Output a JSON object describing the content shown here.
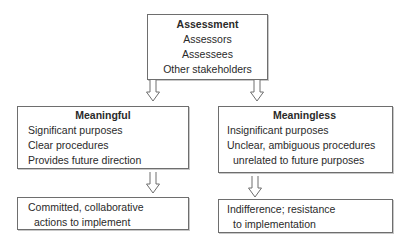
{
  "top": {
    "title": "Assessment",
    "items": [
      "Assessors",
      "Assessees",
      "Other stakeholders"
    ]
  },
  "left": {
    "title": "Meaningful",
    "items": [
      "Significant purposes",
      "Clear procedures",
      "Provides future direction"
    ],
    "outcome": [
      "Committed, collaborative",
      "actions to implement"
    ]
  },
  "right": {
    "title": "Meaningless",
    "items": [
      "Insignificant purposes",
      "Unclear, ambiguous procedures",
      "unrelated to future purposes"
    ],
    "outcome": [
      "Indifference; resistance",
      "to implementation"
    ]
  },
  "arrows": {
    "style": "hollow-down-arrow",
    "stroke": "#6e6e6e"
  }
}
